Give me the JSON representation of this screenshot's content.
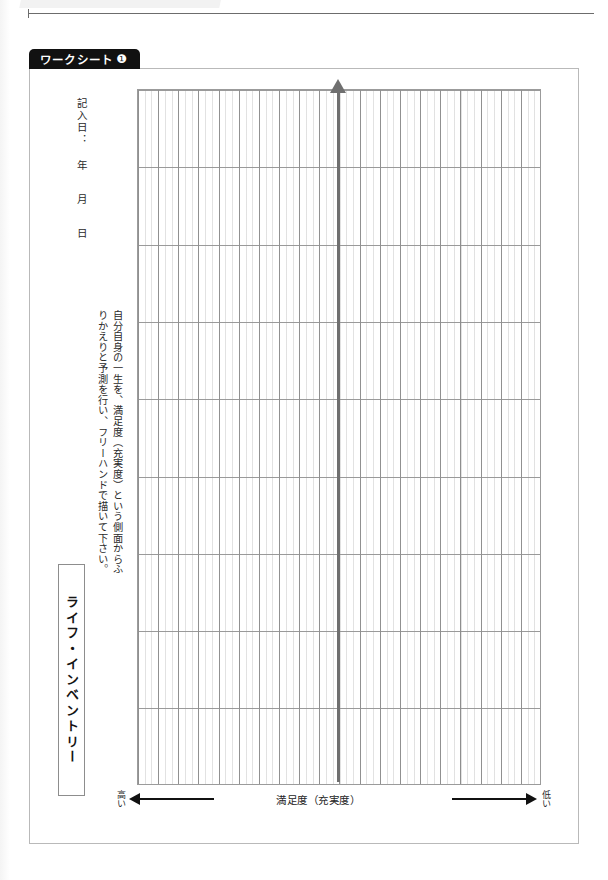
{
  "running_header": {
    "title": "Mental Health"
  },
  "worksheet_tab": {
    "label": "ワークシート",
    "number": "❶"
  },
  "date_field": {
    "label": "記入日：",
    "year_unit": "年",
    "month_unit": "月",
    "day_unit": "日"
  },
  "title": {
    "text": "ライフ・インベントリー"
  },
  "description": {
    "line1": "自分自身の一生を、満足度（充実度）という側面からふりかえりと予測を行い、フリーハンドで描いて下さい。",
    "line1_part_a": "自分自身の一生を、満足度（充実度）という側面からふ",
    "line1_part_b": "りかえりと予測を行い、フリーハンドで描いて下さい。"
  },
  "chart_data": {
    "type": "line",
    "title": "ライフ・インベントリー",
    "xlabel": "満足度（充実度）",
    "ylabel": "",
    "series": [],
    "categories": [],
    "values": [],
    "grid": true,
    "columns": 20,
    "rows": 9,
    "axis_center_label": "満足度（充実度）",
    "axis_left_label": "高い",
    "axis_right_label": "低い",
    "note": "Blank worksheet grid for hand-drawn life satisfaction curve; no plotted data points."
  },
  "axis": {
    "left_label": "高い",
    "right_label": "低い",
    "center_label": "満足度（充実度）"
  },
  "colors": {
    "tab_background": "#111111",
    "tab_text": "#ffffff",
    "grid_major": "#8e8e8e",
    "grid_minor": "#96969647",
    "axis_arrow": "#6f6f6f",
    "frame_border": "#b9b9b9",
    "arrow_black": "#111111"
  }
}
